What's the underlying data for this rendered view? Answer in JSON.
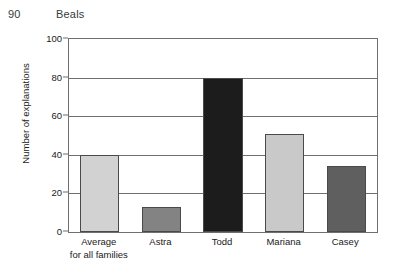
{
  "page": {
    "folio": "90",
    "running_title": "Beals"
  },
  "chart_data": {
    "type": "bar",
    "title": "",
    "xlabel": "",
    "ylabel": "Number of explanations",
    "categories": [
      "Average for all families",
      "Astra",
      "Todd",
      "Mariana",
      "Casey"
    ],
    "category_labels": [
      [
        "Average",
        "for all families"
      ],
      [
        "Astra"
      ],
      [
        "Todd"
      ],
      [
        "Mariana"
      ],
      [
        "Casey"
      ]
    ],
    "values": [
      40,
      13,
      80,
      51,
      34
    ],
    "bar_colors": [
      "#d2d2d2",
      "#838383",
      "#1c1c1c",
      "#c9c9c9",
      "#5f5f5f"
    ],
    "bar_border_color": "#4a4a4a",
    "ylim": [
      0,
      100
    ],
    "yticks": [
      0,
      20,
      40,
      60,
      80,
      100
    ],
    "ytick_labels": [
      "0",
      "20",
      "40",
      "60",
      "80",
      "100"
    ],
    "grid": true,
    "grid_axis": "y",
    "grid_color": "#6f6f6f",
    "legend": false,
    "legend_position": "none",
    "axis_color": "#6f6f6f",
    "plot_background": "#ffffff"
  }
}
